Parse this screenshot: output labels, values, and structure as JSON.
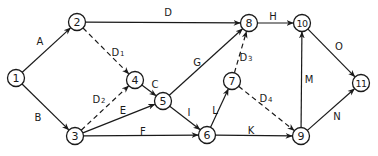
{
  "diagram": {
    "type": "activity-on-arrow network",
    "colors": {
      "stroke": "#1a1a1a",
      "background": "#ffffff"
    },
    "node_radius": 8.5,
    "nodes": [
      {
        "id": "1",
        "label": "1",
        "x": 16,
        "y": 78
      },
      {
        "id": "2",
        "label": "2",
        "x": 77,
        "y": 22
      },
      {
        "id": "3",
        "label": "3",
        "x": 75,
        "y": 136
      },
      {
        "id": "4",
        "label": "4",
        "x": 135,
        "y": 80
      },
      {
        "id": "5",
        "label": "5",
        "x": 163,
        "y": 101
      },
      {
        "id": "6",
        "label": "6",
        "x": 207,
        "y": 135
      },
      {
        "id": "7",
        "label": "7",
        "x": 232,
        "y": 81
      },
      {
        "id": "8",
        "label": "8",
        "x": 249,
        "y": 23
      },
      {
        "id": "9",
        "label": "9",
        "x": 301,
        "y": 136
      },
      {
        "id": "10",
        "label": "10",
        "x": 302,
        "y": 23
      },
      {
        "id": "11",
        "label": "11",
        "x": 361,
        "y": 83
      }
    ],
    "edges": [
      {
        "from": "1",
        "to": "2",
        "label": "A",
        "sub": "",
        "dashed": false,
        "lx": 40,
        "ly": 41
      },
      {
        "from": "1",
        "to": "3",
        "label": "B",
        "sub": "",
        "dashed": false,
        "lx": 38,
        "ly": 117
      },
      {
        "from": "2",
        "to": "8",
        "label": "D",
        "sub": "",
        "dashed": false,
        "lx": 168,
        "ly": 12
      },
      {
        "from": "2",
        "to": "4",
        "label": "D",
        "sub": "1",
        "dashed": true,
        "lx": 118,
        "ly": 52
      },
      {
        "from": "3",
        "to": "4",
        "label": "D",
        "sub": "2",
        "dashed": true,
        "lx": 99,
        "ly": 99
      },
      {
        "from": "4",
        "to": "5",
        "label": "C",
        "sub": "",
        "dashed": false,
        "lx": 155,
        "ly": 84
      },
      {
        "from": "3",
        "to": "5",
        "label": "E",
        "sub": "",
        "dashed": false,
        "lx": 123,
        "ly": 110
      },
      {
        "from": "3",
        "to": "6",
        "label": "F",
        "sub": "",
        "dashed": false,
        "lx": 143,
        "ly": 131
      },
      {
        "from": "5",
        "to": "8",
        "label": "G",
        "sub": "",
        "dashed": false,
        "lx": 197,
        "ly": 62
      },
      {
        "from": "5",
        "to": "6",
        "label": "I",
        "sub": "",
        "dashed": false,
        "lx": 189,
        "ly": 112
      },
      {
        "from": "6",
        "to": "7",
        "label": "L",
        "sub": "",
        "dashed": false,
        "lx": 215,
        "ly": 110
      },
      {
        "from": "7",
        "to": "8",
        "label": "D",
        "sub": "3",
        "dashed": true,
        "lx": 246,
        "ly": 57
      },
      {
        "from": "7",
        "to": "9",
        "label": "D",
        "sub": "4",
        "dashed": true,
        "lx": 266,
        "ly": 98
      },
      {
        "from": "6",
        "to": "9",
        "label": "K",
        "sub": "",
        "dashed": false,
        "lx": 251,
        "ly": 130
      },
      {
        "from": "8",
        "to": "10",
        "label": "H",
        "sub": "",
        "dashed": false,
        "lx": 273,
        "ly": 16
      },
      {
        "from": "9",
        "to": "10",
        "label": "M",
        "sub": "",
        "dashed": false,
        "lx": 309,
        "ly": 79
      },
      {
        "from": "10",
        "to": "11",
        "label": "O",
        "sub": "",
        "dashed": false,
        "lx": 339,
        "ly": 46
      },
      {
        "from": "9",
        "to": "11",
        "label": "N",
        "sub": "",
        "dashed": false,
        "lx": 337,
        "ly": 116
      }
    ]
  }
}
